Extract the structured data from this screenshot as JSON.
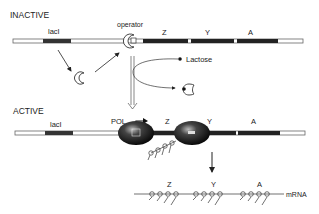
{
  "inactive": {
    "title": "INACTIVE",
    "gene_label": "lacI",
    "operator_label": "operator",
    "genes": [
      "Z",
      "Y",
      "A"
    ],
    "inducer_label": "Lactose"
  },
  "active": {
    "title": "ACTIVE",
    "gene_label": "lacI",
    "polymerase_label": "POL",
    "genes": [
      "Z",
      "Y",
      "A"
    ],
    "mrna_genes": [
      "Z",
      "Y",
      "A"
    ],
    "mrna_label": "mRNA"
  },
  "colors": {
    "gene_dark": "#222222",
    "dna_outline": "#555555",
    "background": "#ffffff"
  }
}
